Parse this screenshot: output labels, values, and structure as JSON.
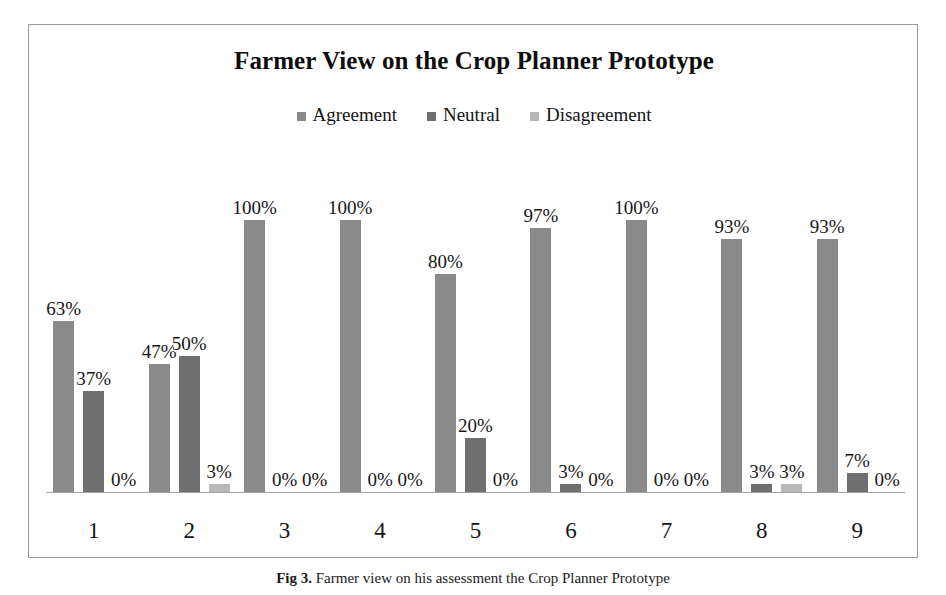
{
  "figure": {
    "caption_prefix": "Fig 3.",
    "caption_text": "Farmer view on his assessment the Crop Planner Prototype"
  },
  "chart_data": {
    "type": "bar",
    "title": "Farmer View on the Crop Planner Prototype",
    "xlabel": "",
    "ylabel": "",
    "ylim": [
      0,
      100
    ],
    "grid": false,
    "legend_position": "top-center",
    "value_suffix": "%",
    "categories": [
      "1",
      "2",
      "3",
      "4",
      "5",
      "6",
      "7",
      "8",
      "9"
    ],
    "series": [
      {
        "name": "Agreement",
        "color": "#8a8a8a",
        "values": [
          63,
          47,
          100,
          100,
          80,
          97,
          100,
          93,
          93
        ],
        "labels": [
          "63%",
          "47%",
          "100%",
          "100%",
          "80%",
          "97%",
          "100%",
          "93%",
          "93%"
        ]
      },
      {
        "name": "Neutral",
        "color": "#6f6f6f",
        "values": [
          37,
          50,
          0,
          0,
          20,
          3,
          0,
          3,
          7
        ],
        "labels": [
          "37%",
          "50%",
          "0%",
          "0%",
          "20%",
          "3%",
          "0%",
          "3%",
          "7%"
        ]
      },
      {
        "name": "Disagreement",
        "color": "#b8b8b8",
        "values": [
          0,
          3,
          0,
          0,
          0,
          0,
          0,
          3,
          0
        ],
        "labels": [
          "0%",
          "3%",
          "0%",
          "0%",
          "0%",
          "0%",
          "0%",
          "3%",
          "0%"
        ]
      }
    ]
  }
}
